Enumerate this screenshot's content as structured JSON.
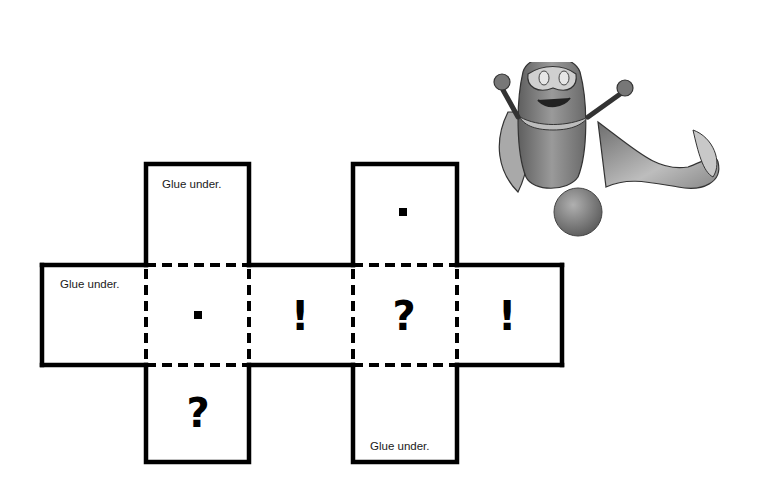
{
  "glue_label": "Glue under.",
  "faces": [
    {
      "id": "top-left-tab",
      "text": "Glue under.",
      "kind": "glue-tab"
    },
    {
      "id": "left-tab",
      "text": "Glue under.",
      "kind": "glue-tab"
    },
    {
      "id": "face-dot",
      "symbol": "dot"
    },
    {
      "id": "face-exclaim-1",
      "symbol": "!"
    },
    {
      "id": "face-question-1",
      "symbol": "?"
    },
    {
      "id": "face-exclaim-2",
      "symbol": "!"
    },
    {
      "id": "face-top-dot",
      "symbol": "dot"
    },
    {
      "id": "face-question-2",
      "symbol": "?"
    },
    {
      "id": "bottom-right-tab",
      "text": "Glue under.",
      "kind": "glue-tab"
    }
  ],
  "symbols": {
    "exclaim": "!",
    "question": "?"
  },
  "colors": {
    "line": "#000000",
    "background": "#ffffff",
    "mascot": "#8a8a8a"
  },
  "mascot": {
    "name": "superhero mascot with mask and cape"
  }
}
